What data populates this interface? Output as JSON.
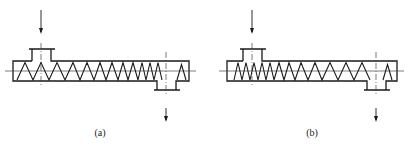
{
  "figure": {
    "panels": [
      {
        "id": "a",
        "caption": "(a)",
        "description": "Screw with pitch decreasing toward outlet; feed inlet at left top, discharge outlet at right bottom",
        "barrel": {
          "x1": 13,
          "x2": 189,
          "y_top": 61,
          "y_bottom": 81
        },
        "inlet": {
          "cx": 41,
          "x1": 32,
          "x2": 51,
          "flange_x1": 29,
          "flange_x2": 55,
          "y_top": 49
        },
        "outlet": {
          "cx": 166,
          "x1": 157,
          "x2": 176,
          "flange_x1": 154,
          "flange_x2": 180,
          "y_bottom": 90
        },
        "zigzag_x": [
          17,
          25,
          33,
          41,
          49,
          57,
          65,
          73,
          80,
          87,
          94,
          100,
          106,
          112,
          118,
          123,
          128,
          133,
          138,
          142,
          146,
          150,
          154,
          158,
          162
        ],
        "tail_peak": {
          "x1": 177,
          "xp": 181.5,
          "x2": 186
        },
        "caption_pos": {
          "x": 100,
          "y": 127
        }
      },
      {
        "id": "b",
        "caption": "(b)",
        "description": "Screw with pitch increasing toward outlet; feed inlet at left top, discharge outlet at right bottom",
        "barrel": {
          "x1": 227,
          "x2": 397,
          "y_top": 61,
          "y_bottom": 81
        },
        "inlet": {
          "cx": 252,
          "x1": 243,
          "x2": 262,
          "flange_x1": 240,
          "flange_x2": 266,
          "y_top": 49
        },
        "outlet": {
          "cx": 376,
          "x1": 367,
          "x2": 386,
          "flange_x1": 364,
          "flange_x2": 390,
          "y_bottom": 90
        },
        "zigzag_x": [
          234,
          238,
          242,
          246,
          250,
          254,
          258,
          262,
          266,
          270,
          274,
          279,
          284,
          289,
          295,
          301,
          308,
          315,
          322,
          330,
          338,
          346,
          354,
          362,
          370
        ],
        "tail_peak": {
          "x1": 383,
          "xp": 387.5,
          "x2": 392
        },
        "caption_pos": {
          "x": 312,
          "y": 127
        }
      }
    ],
    "style": {
      "line_color": "#1a1a1a",
      "centerline_color": "#444444",
      "background": "#ffffff"
    }
  }
}
